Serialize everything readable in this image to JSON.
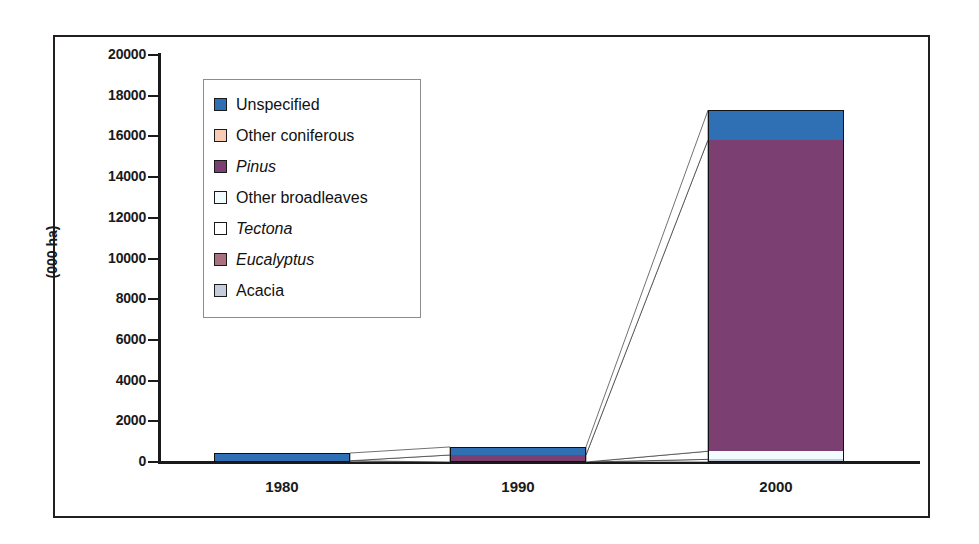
{
  "chart_data": {
    "type": "bar",
    "subtype": "stacked-bar-with-band-connectors",
    "title": "",
    "xlabel": "",
    "ylabel": "(000 ha)",
    "categories": [
      "1980",
      "1990",
      "2000"
    ],
    "ylim": [
      0,
      20000
    ],
    "ytick_step": 2000,
    "yticks": [
      "20000",
      "18000",
      "16000",
      "14000",
      "12000",
      "10000",
      "8000",
      "6000",
      "4000",
      "2000",
      "0"
    ],
    "grid": false,
    "legend_position": "inside-upper-left",
    "series": [
      {
        "name": "Unspecified",
        "italic": false,
        "color": "#2f70b5",
        "values": [
          380,
          395,
          1450
        ]
      },
      {
        "name": "Other coniferous",
        "italic": false,
        "color": "#f7cbb4",
        "values": [
          0,
          0,
          0
        ]
      },
      {
        "name": "Pinus",
        "italic": true,
        "color": "#7b3f72",
        "values": [
          0,
          345,
          15300
        ]
      },
      {
        "name": "Other broadleaves",
        "italic": false,
        "color": "#f2fbfd",
        "values": [
          60,
          0,
          400
        ]
      },
      {
        "name": "Tectona",
        "italic": true,
        "color": "#ffffff",
        "values": [
          0,
          0,
          0
        ]
      },
      {
        "name": "Eucalyptus",
        "italic": true,
        "color": "#a9707f",
        "values": [
          0,
          0,
          0
        ]
      },
      {
        "name": "Acacia",
        "italic": false,
        "color": "#c3cddd",
        "values": [
          0,
          0,
          130
        ]
      }
    ],
    "totals": [
      440,
      740,
      17690
    ]
  },
  "axis": {
    "y_title": "(000 ha)",
    "y_tick_labels": [
      "20000",
      "18000",
      "16000",
      "14000",
      "12000",
      "10000",
      "8000",
      "6000",
      "4000",
      "2000",
      "0"
    ],
    "x_tick_labels": [
      "1980",
      "1990",
      "2000"
    ]
  },
  "legend": {
    "items": [
      {
        "label": "Unspecified"
      },
      {
        "label": "Other coniferous"
      },
      {
        "label": "Pinus"
      },
      {
        "label": "Other broadleaves"
      },
      {
        "label": "Tectona"
      },
      {
        "label": "Eucalyptus"
      },
      {
        "label": "Acacia"
      }
    ]
  },
  "colors": {
    "unspecified": "#2f70b5",
    "other_coniferous": "#f7cbb4",
    "pinus": "#7b3f72",
    "other_broadleaves": "#f2fbfd",
    "tectona": "#ffffff",
    "eucalyptus": "#a9707f",
    "acacia": "#c3cddd",
    "axis": "#1a1a1a",
    "frame": "#231f20"
  }
}
